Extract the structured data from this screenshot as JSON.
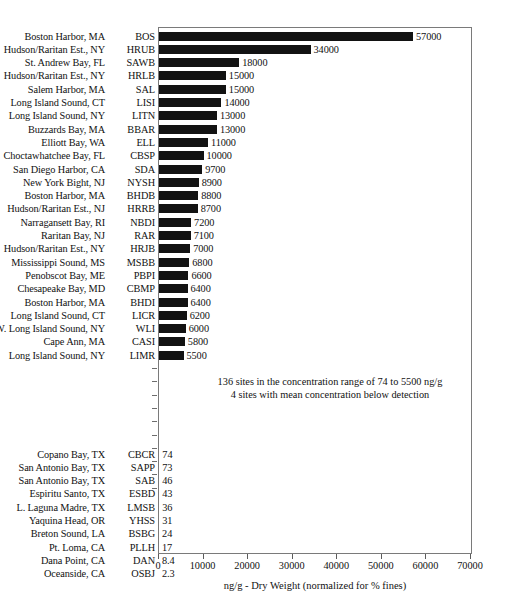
{
  "chart_data": {
    "type": "bar",
    "orientation": "horizontal",
    "title": "",
    "xlabel": "ng/g - Dry Weight (normalized for % fines)",
    "ylabel": "",
    "xlim": [
      0,
      70000
    ],
    "xticks": [
      0,
      10000,
      20000,
      30000,
      40000,
      50000,
      60000,
      70000
    ],
    "xtick_labels": [
      "0",
      "10000",
      "20000",
      "30000",
      "40000",
      "50000",
      "60000",
      "70000"
    ],
    "grid": false,
    "legend": null,
    "bar_color": "#121212",
    "frame_color": "#7a7a7a",
    "categories": [
      "BOS",
      "HRUB",
      "SAWB",
      "HRLB",
      "SAL",
      "LISI",
      "LITN",
      "BBAR",
      "ELL",
      "CBSP",
      "SDA",
      "NYSH",
      "BHDB",
      "HRRB",
      "NBDI",
      "RAR",
      "HRJB",
      "MSBB",
      "PBPI",
      "CBMP",
      "BHDI",
      "LICR",
      "WLI",
      "CASI",
      "LIMR",
      "CBCR",
      "SAPP",
      "SAB",
      "ESBD",
      "LMSB",
      "YHSS",
      "BSBG",
      "PLLH",
      "DAN",
      "OSBJ"
    ],
    "values": [
      57000,
      34000,
      18000,
      15000,
      15000,
      14000,
      13000,
      13000,
      11000,
      10000,
      9700,
      8900,
      8800,
      8700,
      7200,
      7100,
      7000,
      6800,
      6600,
      6400,
      6400,
      6200,
      6000,
      5800,
      5500,
      74,
      73,
      46,
      43,
      36,
      31,
      24,
      17,
      8.4,
      2.3
    ],
    "rows": [
      {
        "site": "Boston Harbor, MA",
        "code": "BOS",
        "value": 57000,
        "value_label": "57000",
        "group": "top"
      },
      {
        "site": "Hudson/Raritan Est., NY",
        "code": "HRUB",
        "value": 34000,
        "value_label": "34000",
        "group": "top"
      },
      {
        "site": "St. Andrew Bay, FL",
        "code": "SAWB",
        "value": 18000,
        "value_label": "18000",
        "group": "top"
      },
      {
        "site": "Hudson/Raritan Est., NY",
        "code": "HRLB",
        "value": 15000,
        "value_label": "15000",
        "group": "top"
      },
      {
        "site": "Salem Harbor, MA",
        "code": "SAL",
        "value": 15000,
        "value_label": "15000",
        "group": "top"
      },
      {
        "site": "Long Island Sound, CT",
        "code": "LISI",
        "value": 14000,
        "value_label": "14000",
        "group": "top"
      },
      {
        "site": "Long Island Sound, NY",
        "code": "LITN",
        "value": 13000,
        "value_label": "13000",
        "group": "top"
      },
      {
        "site": "Buzzards Bay, MA",
        "code": "BBAR",
        "value": 13000,
        "value_label": "13000",
        "group": "top"
      },
      {
        "site": "Elliott Bay, WA",
        "code": "ELL",
        "value": 11000,
        "value_label": "11000",
        "group": "top"
      },
      {
        "site": "Choctawhatchee Bay, FL",
        "code": "CBSP",
        "value": 10000,
        "value_label": "10000",
        "group": "top"
      },
      {
        "site": "San Diego Harbor, CA",
        "code": "SDA",
        "value": 9700,
        "value_label": "9700",
        "group": "top"
      },
      {
        "site": "New York Bight, NJ",
        "code": "NYSH",
        "value": 8900,
        "value_label": "8900",
        "group": "top"
      },
      {
        "site": "Boston Harbor, MA",
        "code": "BHDB",
        "value": 8800,
        "value_label": "8800",
        "group": "top"
      },
      {
        "site": "Hudson/Raritan Est., NJ",
        "code": "HRRB",
        "value": 8700,
        "value_label": "8700",
        "group": "top"
      },
      {
        "site": "Narragansett Bay, RI",
        "code": "NBDI",
        "value": 7200,
        "value_label": "7200",
        "group": "top"
      },
      {
        "site": "Raritan Bay, NJ",
        "code": "RAR",
        "value": 7100,
        "value_label": "7100",
        "group": "top"
      },
      {
        "site": "Hudson/Raritan Est., NY",
        "code": "HRJB",
        "value": 7000,
        "value_label": "7000",
        "group": "top"
      },
      {
        "site": "Mississippi Sound, MS",
        "code": "MSBB",
        "value": 6800,
        "value_label": "6800",
        "group": "top"
      },
      {
        "site": "Penobscot Bay, ME",
        "code": "PBPI",
        "value": 6600,
        "value_label": "6600",
        "group": "top"
      },
      {
        "site": "Chesapeake Bay, MD",
        "code": "CBMP",
        "value": 6400,
        "value_label": "6400",
        "group": "top"
      },
      {
        "site": "Boston Harbor, MA",
        "code": "BHDI",
        "value": 6400,
        "value_label": "6400",
        "group": "top"
      },
      {
        "site": "Long Island Sound, CT",
        "code": "LICR",
        "value": 6200,
        "value_label": "6200",
        "group": "top"
      },
      {
        "site": "W. Long Island Sound, NY",
        "code": "WLI",
        "value": 6000,
        "value_label": "6000",
        "group": "top"
      },
      {
        "site": "Cape Ann, MA",
        "code": "CASI",
        "value": 5800,
        "value_label": "5800",
        "group": "top"
      },
      {
        "site": "Long Island Sound, NY",
        "code": "LIMR",
        "value": 5500,
        "value_label": "5500",
        "group": "top"
      },
      {
        "site": "Copano Bay, TX",
        "code": "CBCR",
        "value": 74,
        "value_label": "74",
        "group": "bottom"
      },
      {
        "site": "San Antonio Bay, TX",
        "code": "SAPP",
        "value": 73,
        "value_label": "73",
        "group": "bottom"
      },
      {
        "site": "San Antonio Bay, TX",
        "code": "SAB",
        "value": 46,
        "value_label": "46",
        "group": "bottom"
      },
      {
        "site": "Espiritu Santo, TX",
        "code": "ESBD",
        "value": 43,
        "value_label": "43",
        "group": "bottom"
      },
      {
        "site": "L. Laguna Madre, TX",
        "code": "LMSB",
        "value": 36,
        "value_label": "36",
        "group": "bottom"
      },
      {
        "site": "Yaquina Head, OR",
        "code": "YHSS",
        "value": 31,
        "value_label": "31",
        "group": "bottom"
      },
      {
        "site": "Breton Sound, LA",
        "code": "BSBG",
        "value": 24,
        "value_label": "24",
        "group": "bottom"
      },
      {
        "site": "Pt. Loma, CA",
        "code": "PLLH",
        "value": 17,
        "value_label": "17",
        "group": "bottom"
      },
      {
        "site": "Dana Point, CA",
        "code": "DAN",
        "value": 8.4,
        "value_label": "8.4",
        "group": "bottom"
      },
      {
        "site": "Oceanside, CA",
        "code": "OSBJ",
        "value": 2.3,
        "value_label": "2.3",
        "group": "bottom"
      }
    ],
    "annotations": [
      "136 sites in the concentration range of 74 to 5500 ng/g",
      "4 sites with mean concentration below detection"
    ],
    "gap_tick_count": 10
  }
}
